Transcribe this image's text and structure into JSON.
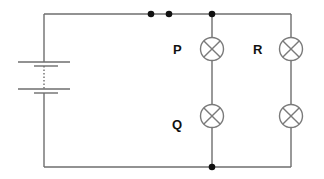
{
  "diagram": {
    "type": "circuit",
    "colors": {
      "wire": "#6e6e6e",
      "node": "#111111",
      "label": "#111111",
      "background": "#ffffff"
    },
    "components": {
      "battery": {
        "cells": 2
      },
      "switch": {
        "type": "open-contacts",
        "state": "closed-dots"
      },
      "lamps": [
        {
          "id": "P",
          "label": "P",
          "branch": "left"
        },
        {
          "id": "Q",
          "label": "Q",
          "branch": "left"
        },
        {
          "id": "R",
          "label": "R",
          "branch": "right"
        },
        {
          "id": "unlabeled",
          "label": "",
          "branch": "right"
        }
      ]
    },
    "labels": {
      "p": "P",
      "q": "Q",
      "r": "R"
    }
  }
}
